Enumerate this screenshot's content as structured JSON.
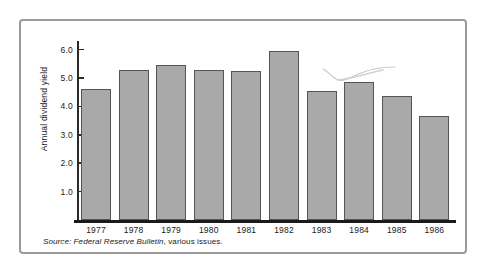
{
  "chart_data": {
    "type": "bar",
    "title": "",
    "subtitle": "",
    "xlabel": "",
    "ylabel": "Annual dividend yield",
    "categories": [
      "1977",
      "1978",
      "1979",
      "1980",
      "1981",
      "1982",
      "1983",
      "1984",
      "1985",
      "1986"
    ],
    "values": [
      4.63,
      5.27,
      5.45,
      5.27,
      5.23,
      5.96,
      4.55,
      4.87,
      4.37,
      3.67
    ],
    "series": [
      {
        "name": "Annual dividend yield",
        "values": [
          4.63,
          5.27,
          5.45,
          5.27,
          5.23,
          5.96,
          4.55,
          4.87,
          4.37,
          3.67
        ]
      }
    ],
    "ylim": [
      0,
      6.4
    ],
    "yticks": [
      1.0,
      2.0,
      3.0,
      4.0,
      5.0,
      6.0
    ],
    "ytick_labels": [
      "1.0",
      "2.0",
      "3.0",
      "4.0",
      "5.0",
      "6.0"
    ],
    "grid": false,
    "legend": null,
    "legend_position": "none",
    "bar_color": "#a9a9a9",
    "bar_edge_color": "#555555",
    "axis_color": "#1a1a1a",
    "annotations": [
      {
        "name": "handdrawn-squiggle",
        "text": "",
        "near_category": "1982",
        "color": "#c9c9c9"
      }
    ]
  },
  "source": {
    "prefix": "Source:",
    "publication": "Federal Reserve Bulletin",
    "suffix": ", various issues."
  },
  "colors": {
    "frame_border": "#9a9a9a",
    "background": "#ffffff",
    "bar_fill": "#a9a9a9",
    "bar_stroke": "#555555",
    "text": "#1a1a1a"
  }
}
